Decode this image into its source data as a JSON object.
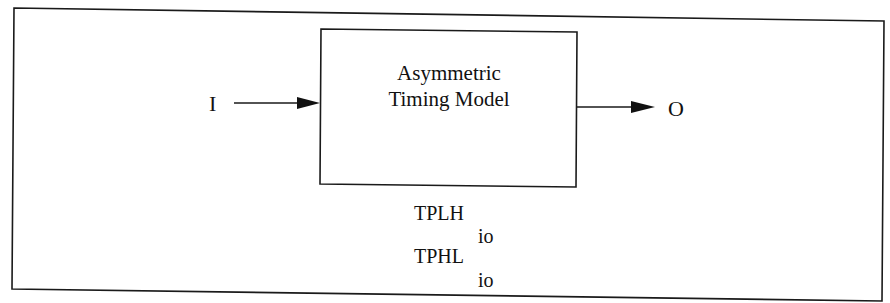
{
  "diagram": {
    "block": {
      "title_line1": "Asymmetric",
      "title_line2": "Timing Model"
    },
    "input": {
      "label": "I"
    },
    "output": {
      "label": "O"
    },
    "parameters": [
      {
        "name": "TPLH",
        "subscript": "io"
      },
      {
        "name": "TPHL",
        "subscript": "io"
      }
    ],
    "colors": {
      "stroke": "#1a1a1a",
      "background": "#ffffff"
    }
  }
}
